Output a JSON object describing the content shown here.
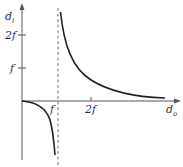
{
  "diagram": {
    "type": "lens-image-distance-graph",
    "y_axis": {
      "label_main": "d",
      "label_sub": "i",
      "ticks": [
        {
          "label": "2f",
          "value": 2
        },
        {
          "label": "f",
          "value": 1
        }
      ]
    },
    "x_axis": {
      "label_main": "d",
      "label_sub": "o",
      "ticks": [
        {
          "label": "f",
          "value": 1
        },
        {
          "label": "2f",
          "value": 2
        }
      ]
    },
    "asymptote": {
      "x": 1,
      "style": "dashed"
    },
    "curves": [
      {
        "name": "real-image-branch",
        "relation": "d_i = f*d_o/(d_o - f)",
        "domain": [
          1.05,
          4.3
        ]
      },
      {
        "name": "virtual-image-branch",
        "relation": "d_i = f*d_o/(d_o - f)",
        "domain": [
          0,
          0.92
        ]
      }
    ],
    "colors": {
      "axis": "#555555",
      "curve": "#222222",
      "dashed": "#777777",
      "text": "#333333"
    }
  }
}
